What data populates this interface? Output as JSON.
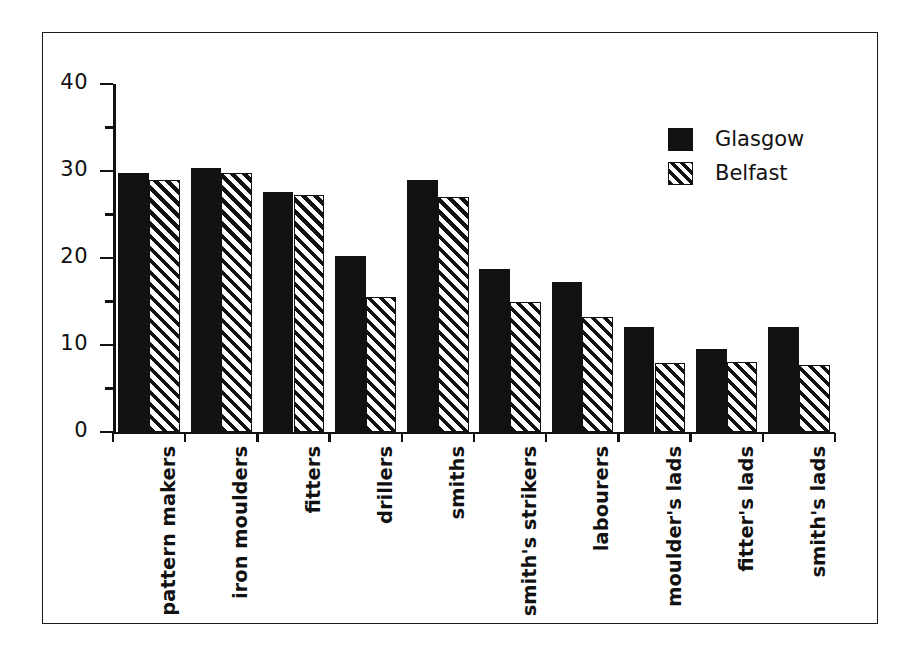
{
  "chart_data": {
    "type": "bar",
    "title": "",
    "subtitle": "",
    "xlabel": "",
    "ylabel": "",
    "ylim": [
      0,
      40
    ],
    "yticks": [
      0,
      10,
      20,
      30,
      40
    ],
    "ytick_labels": [
      "0",
      "10",
      "20",
      "30",
      "40"
    ],
    "yminor_ticks": [
      5,
      15,
      25,
      35
    ],
    "grid": false,
    "legend_position": "upper right",
    "categories": [
      "pattern makers",
      "iron moulders",
      "fitters",
      "drillers",
      "smiths",
      "smith's strikers",
      "labourers",
      "moulder's lads",
      "fitter's lads",
      "smith's lads"
    ],
    "series": [
      {
        "name": "Glasgow",
        "pattern": "solid",
        "color": "#111111",
        "values": [
          29.8,
          30.3,
          27.6,
          20.2,
          29.0,
          18.7,
          17.2,
          12.1,
          9.5,
          12.1
        ]
      },
      {
        "name": "Belfast",
        "pattern": "diagonal-hatch",
        "color": "#111111",
        "values": [
          29.0,
          29.8,
          27.3,
          15.5,
          27.0,
          15.0,
          13.2,
          7.9,
          8.0,
          7.7
        ]
      }
    ]
  },
  "legend": {
    "entries": [
      {
        "label": "Glasgow",
        "swatch": "solid-black-swatch"
      },
      {
        "label": "Belfast",
        "swatch": "hatched-swatch"
      }
    ]
  }
}
